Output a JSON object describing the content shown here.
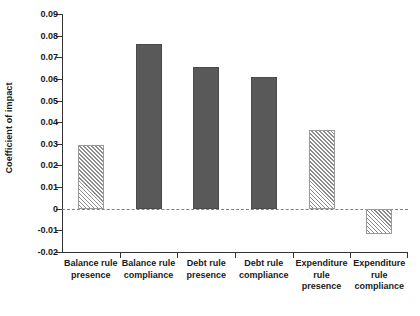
{
  "chart_data": {
    "type": "bar",
    "title": "",
    "xlabel": "",
    "ylabel": "Coefficient of impact",
    "categories": [
      "Balance rule presence",
      "Balance rule compliance",
      "Debt rule presence",
      "Debt rule compliance",
      "Expenditure rule presence",
      "Expenditure rule compliance"
    ],
    "category_lines": [
      [
        "Balance rule",
        "presence"
      ],
      [
        "Balance rule",
        "compliance"
      ],
      [
        "Debt rule",
        "presence"
      ],
      [
        "Debt rule",
        "compliance"
      ],
      [
        "Expenditure",
        "rule presence"
      ],
      [
        "Expenditure",
        "rule",
        "compliance"
      ]
    ],
    "values": [
      0.0295,
      0.076,
      0.0655,
      0.061,
      0.0365,
      -0.0115
    ],
    "bar_styles": [
      "hatched",
      "solid",
      "solid",
      "solid",
      "hatched",
      "hatched"
    ],
    "ylim": [
      -0.02,
      0.09
    ],
    "yticks": [
      0.09,
      0.08,
      0.07,
      0.06,
      0.05,
      0.04,
      0.03,
      0.02,
      0.01,
      0,
      -0.01,
      -0.02
    ],
    "ytick_labels": [
      "0.09",
      "0.08",
      "0.07",
      "0.06",
      "0.05",
      "0.04",
      "0.03",
      "0.02",
      "0.01",
      "0",
      "-0.01",
      "-0.02"
    ],
    "zero_line": 0,
    "grid": false,
    "legend": null,
    "colors": {
      "solid_bar": "#595959",
      "hatch_line": "#8c8c8c",
      "hatch_background": "#ffffff",
      "axis": "#333333",
      "zero_line": "#808080",
      "text": "#1a1a1a",
      "background": "#ffffff"
    }
  }
}
